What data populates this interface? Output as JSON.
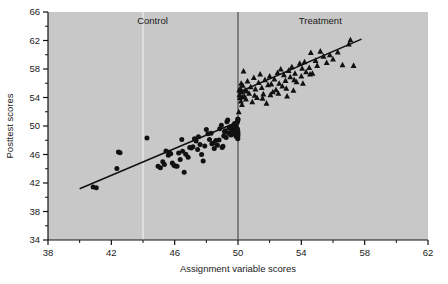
{
  "chart_data": {
    "type": "scatter",
    "title": "",
    "xlabel": "Assignment variable scores",
    "ylabel": "Posttest scores",
    "xlim": [
      38,
      62
    ],
    "ylim": [
      34,
      66
    ],
    "xticks": [
      38,
      42,
      46,
      50,
      54,
      58,
      62
    ],
    "yticks": [
      34,
      38,
      42,
      46,
      50,
      54,
      58,
      62,
      66
    ],
    "xtick_labels": [
      "38",
      "42",
      "46",
      "50",
      "54",
      "58",
      "62"
    ],
    "ytick_labels": [
      "34",
      "38",
      "42",
      "46",
      "50",
      "54",
      "58",
      "62",
      "66"
    ],
    "minor_tick_step": 2,
    "grid": false,
    "legend_position": "none",
    "plot_background": "#c8c8c8",
    "marker_color": "#111111",
    "line_color": "#111111",
    "cutoff": {
      "x": 50,
      "label": "cutoff",
      "color": "#555555"
    },
    "guide_line": {
      "x": 44,
      "color": "#e8e8e8"
    },
    "annotations": [
      {
        "text": "Control",
        "x": 44.6,
        "y": 64.3
      },
      {
        "text": "Treatment",
        "x": 55.2,
        "y": 64.3
      }
    ],
    "series": [
      {
        "name": "Control",
        "marker": "circle",
        "fit_line": {
          "x0": 40.0,
          "y0": 41.2,
          "x1": 50.0,
          "y1": 50.6
        },
        "points": [
          [
            40.85,
            41.45
          ],
          [
            41.05,
            41.35
          ],
          [
            42.35,
            44.05
          ],
          [
            42.45,
            46.35
          ],
          [
            42.55,
            46.25
          ],
          [
            44.25,
            48.3
          ],
          [
            44.95,
            44.35
          ],
          [
            45.1,
            44.15
          ],
          [
            45.25,
            45.0
          ],
          [
            45.35,
            44.6
          ],
          [
            45.45,
            46.5
          ],
          [
            45.6,
            45.9
          ],
          [
            45.65,
            46.3
          ],
          [
            45.75,
            46.1
          ],
          [
            45.85,
            44.8
          ],
          [
            45.95,
            44.5
          ],
          [
            46.05,
            44.4
          ],
          [
            46.15,
            44.35
          ],
          [
            46.25,
            46.2
          ],
          [
            46.35,
            45.3
          ],
          [
            46.45,
            48.1
          ],
          [
            46.5,
            46.45
          ],
          [
            46.6,
            43.5
          ],
          [
            46.7,
            46.05
          ],
          [
            46.85,
            45.6
          ],
          [
            46.95,
            47.0
          ],
          [
            47.05,
            46.9
          ],
          [
            47.15,
            47.1
          ],
          [
            47.25,
            48.2
          ],
          [
            47.35,
            47.9
          ],
          [
            47.45,
            46.7
          ],
          [
            47.5,
            48.5
          ],
          [
            47.6,
            47.4
          ],
          [
            47.7,
            46.0
          ],
          [
            47.8,
            45.1
          ],
          [
            47.9,
            47.2
          ],
          [
            48.0,
            49.5
          ],
          [
            48.1,
            48.9
          ],
          [
            48.2,
            48.1
          ],
          [
            48.3,
            49.0
          ],
          [
            48.35,
            47.5
          ],
          [
            48.45,
            47.6
          ],
          [
            48.5,
            46.85
          ],
          [
            48.6,
            47.95
          ],
          [
            48.7,
            47.3
          ],
          [
            48.8,
            48.05
          ],
          [
            48.85,
            49.6
          ],
          [
            48.95,
            50.1
          ],
          [
            49.0,
            47.0
          ],
          [
            49.05,
            47.15
          ],
          [
            49.1,
            48.6
          ],
          [
            49.15,
            49.2
          ],
          [
            49.2,
            49.35
          ],
          [
            49.25,
            48.4
          ],
          [
            49.3,
            50.6
          ],
          [
            49.35,
            50.85
          ],
          [
            49.4,
            49.0
          ],
          [
            49.45,
            49.7
          ],
          [
            49.5,
            49.85
          ],
          [
            49.55,
            48.75
          ],
          [
            49.6,
            49.3
          ],
          [
            49.65,
            50.0
          ],
          [
            49.7,
            49.55
          ],
          [
            49.72,
            49.15
          ],
          [
            49.75,
            48.9
          ],
          [
            49.78,
            50.35
          ],
          [
            49.8,
            49.45
          ],
          [
            49.82,
            49.9
          ],
          [
            49.85,
            49.1
          ],
          [
            49.87,
            48.55
          ],
          [
            49.88,
            50.2
          ],
          [
            49.9,
            49.75
          ],
          [
            49.92,
            49.25
          ],
          [
            49.94,
            48.8
          ],
          [
            49.95,
            50.5
          ],
          [
            49.96,
            49.6
          ],
          [
            49.97,
            48.4
          ],
          [
            49.98,
            50.75
          ],
          [
            49.98,
            49.4
          ],
          [
            49.99,
            48.2
          ],
          [
            49.99,
            51.0
          ],
          [
            50.0,
            49.05
          ],
          [
            50.0,
            50.9
          ],
          [
            50.0,
            48.65
          ]
        ]
      },
      {
        "name": "Treatment",
        "marker": "triangle",
        "fit_line": {
          "x0": 50.0,
          "y0": 54.7,
          "x1": 57.8,
          "y1": 62.2
        },
        "points": [
          [
            50.05,
            52.0
          ],
          [
            50.1,
            54.4
          ],
          [
            50.12,
            54.0
          ],
          [
            50.15,
            55.3
          ],
          [
            50.18,
            53.5
          ],
          [
            50.2,
            56.0
          ],
          [
            50.22,
            54.8
          ],
          [
            50.25,
            53.0
          ],
          [
            50.3,
            55.7
          ],
          [
            50.35,
            57.7
          ],
          [
            50.4,
            54.2
          ],
          [
            50.45,
            55.0
          ],
          [
            50.5,
            53.8
          ],
          [
            50.6,
            56.3
          ],
          [
            50.7,
            54.6
          ],
          [
            50.8,
            55.5
          ],
          [
            50.9,
            53.4
          ],
          [
            51.0,
            56.8
          ],
          [
            51.1,
            55.2
          ],
          [
            51.2,
            54.0
          ],
          [
            51.3,
            56.1
          ],
          [
            51.4,
            57.3
          ],
          [
            51.5,
            55.4
          ],
          [
            51.6,
            54.5
          ],
          [
            51.7,
            56.5
          ],
          [
            51.8,
            53.2
          ],
          [
            51.9,
            55.8
          ],
          [
            52.0,
            57.0
          ],
          [
            52.1,
            55.9
          ],
          [
            52.2,
            54.8
          ],
          [
            52.3,
            56.6
          ],
          [
            52.4,
            55.1
          ],
          [
            52.5,
            57.5
          ],
          [
            52.6,
            56.0
          ],
          [
            52.7,
            58.0
          ],
          [
            52.8,
            55.6
          ],
          [
            52.9,
            57.2
          ],
          [
            53.0,
            56.4
          ],
          [
            53.1,
            54.2
          ],
          [
            53.2,
            57.8
          ],
          [
            53.3,
            56.9
          ],
          [
            53.4,
            58.3
          ],
          [
            53.5,
            55.0
          ],
          [
            53.6,
            57.4
          ],
          [
            53.7,
            56.2
          ],
          [
            53.9,
            58.8
          ],
          [
            54.0,
            57.0
          ],
          [
            54.1,
            56.0
          ],
          [
            54.2,
            59.0
          ],
          [
            54.3,
            57.6
          ],
          [
            54.5,
            58.2
          ],
          [
            54.6,
            60.3
          ],
          [
            54.7,
            57.4
          ],
          [
            54.9,
            59.2
          ],
          [
            55.0,
            58.5
          ],
          [
            55.2,
            60.5
          ],
          [
            55.4,
            59.8
          ],
          [
            55.6,
            58.9
          ],
          [
            55.8,
            60.0
          ],
          [
            56.0,
            59.4
          ],
          [
            56.3,
            60.4
          ],
          [
            56.6,
            58.6
          ],
          [
            57.0,
            61.5
          ],
          [
            57.1,
            62.1
          ],
          [
            57.3,
            58.5
          ],
          [
            50.08,
            55.1
          ],
          [
            50.28,
            54.1
          ],
          [
            50.55,
            54.9
          ],
          [
            51.05,
            54.3
          ],
          [
            51.55,
            53.9
          ],
          [
            52.05,
            54.4
          ],
          [
            52.55,
            54.6
          ],
          [
            53.05,
            55.3
          ],
          [
            53.55,
            56.5
          ],
          [
            54.05,
            58.1
          ],
          [
            54.55,
            57.3
          ]
        ]
      }
    ]
  }
}
